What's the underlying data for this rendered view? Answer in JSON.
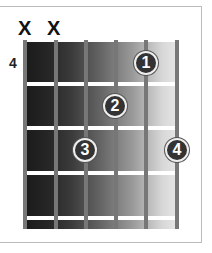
{
  "chord_diagram": {
    "start_fret": "4",
    "strings": 6,
    "muted_strings": [
      {
        "string": 1,
        "symbol": "X"
      },
      {
        "string": 2,
        "symbol": "X"
      }
    ],
    "fingers": [
      {
        "label": "1",
        "string": 5,
        "fret": 1
      },
      {
        "label": "2",
        "string": 4,
        "fret": 2
      },
      {
        "label": "3",
        "string": 3,
        "fret": 3
      },
      {
        "label": "4",
        "string": 6,
        "fret": 3
      }
    ]
  }
}
